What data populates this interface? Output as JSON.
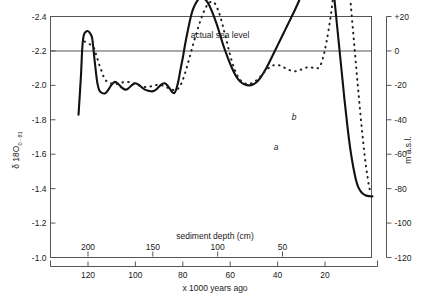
{
  "chart_data": {
    "type": "line",
    "title": "",
    "annotations": [
      {
        "text": "actual sea level",
        "x_px": 220,
        "y_px": 38
      },
      {
        "text": "a",
        "x_px": 276,
        "y_px": 150
      },
      {
        "text": "b",
        "x_px": 294,
        "y_px": 120
      }
    ],
    "axes": {
      "left": {
        "label": "δ 18O",
        "label_sub": "0 - 81",
        "ticks": [
          "-2.4",
          "-2.2",
          "-2.0",
          "-1.8",
          "-1.6",
          "-1.4",
          "-1.2",
          "-1.0"
        ],
        "range": [
          -2.4,
          -1.0
        ],
        "inverted": true
      },
      "right": {
        "label": "m a.s.l.",
        "ticks": [
          "+20",
          "0",
          "-20",
          "-40",
          "-60",
          "-80",
          "-100",
          "-120"
        ],
        "range": [
          20,
          -120
        ]
      },
      "bottom": {
        "label": "x 1000 years ago",
        "ticks": [
          "120",
          "100",
          "80",
          "60",
          "40",
          "20"
        ],
        "tick_values": [
          120,
          100,
          80,
          60,
          40,
          20
        ]
      },
      "top": {
        "label": "sediment depth (cm)",
        "ticks": [
          "200",
          "150",
          "100",
          "50"
        ],
        "tick_values": [
          200,
          150,
          100,
          50
        ]
      },
      "grid": false,
      "legend": "inline-labels"
    },
    "series": [
      {
        "name": "a",
        "style": "solid",
        "description": "oxygen isotope / sea level curve, solid line",
        "points": [
          [
            124,
            -1.83
          ],
          [
            123,
            -2.05
          ],
          [
            122.4,
            -2.22
          ],
          [
            121.8,
            -2.29
          ],
          [
            121,
            -2.31
          ],
          [
            120,
            -2.315
          ],
          [
            119,
            -2.3
          ],
          [
            118.2,
            -2.27
          ],
          [
            117.4,
            -2.17
          ],
          [
            116.6,
            -2.07
          ],
          [
            116,
            -2.01
          ],
          [
            115.2,
            -1.97
          ],
          [
            114,
            -1.955
          ],
          [
            112.6,
            -1.955
          ],
          [
            111.4,
            -1.975
          ],
          [
            110,
            -2.005
          ],
          [
            108.6,
            -2.02
          ],
          [
            107,
            -2.005
          ],
          [
            105.6,
            -1.985
          ],
          [
            104.2,
            -1.975
          ],
          [
            103,
            -1.982
          ],
          [
            101.6,
            -2.0
          ],
          [
            100.2,
            -2.012
          ],
          [
            98.8,
            -2.005
          ],
          [
            97.4,
            -1.99
          ],
          [
            96,
            -1.975
          ],
          [
            94.4,
            -1.968
          ],
          [
            93,
            -1.965
          ],
          [
            91.6,
            -1.972
          ],
          [
            90.2,
            -1.99
          ],
          [
            89,
            -2.005
          ],
          [
            87.6,
            -2.012
          ],
          [
            86.4,
            -1.998
          ],
          [
            85.2,
            -1.975
          ],
          [
            84.2,
            -1.958
          ],
          [
            83.4,
            -1.958
          ],
          [
            82.6,
            -1.985
          ],
          [
            81.8,
            -2.03
          ],
          [
            81,
            -2.09
          ],
          [
            80,
            -2.16
          ],
          [
            79,
            -2.24
          ],
          [
            78,
            -2.31
          ],
          [
            77,
            -2.375
          ],
          [
            76,
            -2.43
          ],
          [
            74.8,
            -2.47
          ],
          [
            73.4,
            -2.5
          ],
          [
            72,
            -2.51
          ],
          [
            70.6,
            -2.5
          ],
          [
            69,
            -2.47
          ],
          [
            67.4,
            -2.42
          ],
          [
            65.8,
            -2.36
          ],
          [
            64.2,
            -2.29
          ],
          [
            62.6,
            -2.22
          ],
          [
            61,
            -2.16
          ],
          [
            59.4,
            -2.105
          ],
          [
            58,
            -2.065
          ],
          [
            56.6,
            -2.035
          ],
          [
            55.2,
            -2.015
          ],
          [
            53.6,
            -2.003
          ],
          [
            52,
            -2.0
          ],
          [
            50.4,
            -2.005
          ],
          [
            48.8,
            -2.02
          ],
          [
            47.2,
            -2.045
          ],
          [
            45.6,
            -2.08
          ],
          [
            44,
            -2.12
          ],
          [
            42.4,
            -2.165
          ],
          [
            40.8,
            -2.21
          ],
          [
            39.2,
            -2.255
          ],
          [
            37.6,
            -2.3
          ],
          [
            36,
            -2.345
          ],
          [
            34.4,
            -2.39
          ],
          [
            32.8,
            -2.435
          ],
          [
            31,
            -2.49
          ],
          [
            29.4,
            -2.545
          ],
          [
            27.8,
            -2.6
          ],
          [
            26.2,
            -2.655
          ],
          [
            24.6,
            -2.705
          ],
          [
            23.2,
            -2.745
          ],
          [
            22,
            -2.775
          ],
          [
            21,
            -2.79
          ],
          [
            20,
            -2.795
          ],
          [
            19,
            -2.78
          ],
          [
            18.2,
            -2.74
          ],
          [
            17.4,
            -2.67
          ],
          [
            16.6,
            -2.58
          ],
          [
            15.8,
            -2.47
          ],
          [
            15,
            -2.36
          ],
          [
            14.2,
            -2.25
          ],
          [
            13.4,
            -2.14
          ],
          [
            12.6,
            -2.03
          ],
          [
            11.8,
            -1.92
          ],
          [
            11,
            -1.82
          ],
          [
            10,
            -1.7
          ],
          [
            9,
            -1.6
          ],
          [
            8,
            -1.52
          ],
          [
            7,
            -1.455
          ],
          [
            6,
            -1.41
          ],
          [
            5,
            -1.385
          ],
          [
            4,
            -1.37
          ],
          [
            3,
            -1.362
          ],
          [
            2,
            -1.358
          ],
          [
            1,
            -1.356
          ],
          [
            0,
            -1.355
          ]
        ]
      },
      {
        "name": "b",
        "style": "dotted",
        "description": "second curve, dotted line",
        "points": [
          [
            121.4,
            -2.255
          ],
          [
            120.4,
            -2.245
          ],
          [
            119.4,
            -2.24
          ],
          [
            118.4,
            -2.23
          ],
          [
            117.4,
            -2.215
          ],
          [
            116.6,
            -2.18
          ],
          [
            115.8,
            -2.145
          ],
          [
            115,
            -2.11
          ],
          [
            114.2,
            -2.08
          ],
          [
            113.4,
            -2.05
          ],
          [
            112.6,
            -2.03
          ],
          [
            111.6,
            -2.02
          ],
          [
            110.4,
            -2.012
          ],
          [
            109.2,
            -2.008
          ],
          [
            108,
            -2.008
          ],
          [
            106.6,
            -2.012
          ],
          [
            105.2,
            -2.018
          ],
          [
            103.8,
            -2.02
          ],
          [
            102.4,
            -2.018
          ],
          [
            101,
            -2.012
          ],
          [
            99.6,
            -2.005
          ],
          [
            98.2,
            -1.998
          ],
          [
            96.8,
            -1.992
          ],
          [
            95.4,
            -1.99
          ],
          [
            94,
            -1.992
          ],
          [
            92.6,
            -1.998
          ],
          [
            91.2,
            -2.002
          ],
          [
            89.8,
            -2.002
          ],
          [
            88.4,
            -1.998
          ],
          [
            87,
            -1.99
          ],
          [
            85.6,
            -1.982
          ],
          [
            84.4,
            -1.975
          ],
          [
            83.2,
            -1.972
          ],
          [
            82.2,
            -1.978
          ],
          [
            81.2,
            -1.995
          ],
          [
            80.2,
            -2.025
          ],
          [
            79.2,
            -2.065
          ],
          [
            78.2,
            -2.11
          ],
          [
            77.2,
            -2.16
          ],
          [
            76.2,
            -2.21
          ],
          [
            75.2,
            -2.26
          ],
          [
            74.2,
            -2.305
          ],
          [
            73.2,
            -2.35
          ],
          [
            72.2,
            -2.39
          ],
          [
            71.2,
            -2.425
          ],
          [
            70.2,
            -2.455
          ],
          [
            69.2,
            -2.475
          ],
          [
            68.2,
            -2.485
          ],
          [
            67.2,
            -2.485
          ],
          [
            66.2,
            -2.47
          ],
          [
            65.2,
            -2.44
          ],
          [
            64.2,
            -2.4
          ],
          [
            63.2,
            -2.35
          ],
          [
            62.2,
            -2.295
          ],
          [
            61.2,
            -2.24
          ],
          [
            60.2,
            -2.185
          ],
          [
            59.2,
            -2.135
          ],
          [
            58.2,
            -2.095
          ],
          [
            57.2,
            -2.062
          ],
          [
            56.2,
            -2.038
          ],
          [
            55,
            -2.022
          ],
          [
            53.8,
            -2.012
          ],
          [
            52.4,
            -2.008
          ],
          [
            51,
            -2.012
          ],
          [
            49.6,
            -2.022
          ],
          [
            48.2,
            -2.038
          ],
          [
            46.8,
            -2.058
          ],
          [
            45.4,
            -2.08
          ],
          [
            44,
            -2.098
          ],
          [
            42.6,
            -2.112
          ],
          [
            41.2,
            -2.118
          ],
          [
            39.8,
            -2.118
          ],
          [
            38.4,
            -2.112
          ],
          [
            37,
            -2.102
          ],
          [
            35.6,
            -2.092
          ],
          [
            34.2,
            -2.085
          ],
          [
            32.8,
            -2.082
          ],
          [
            31.4,
            -2.085
          ],
          [
            30,
            -2.092
          ],
          [
            28.6,
            -2.1
          ],
          [
            27.2,
            -2.105
          ],
          [
            26,
            -2.105
          ],
          [
            24.8,
            -2.1
          ],
          [
            23.6,
            -2.098
          ],
          [
            22.4,
            -2.105
          ],
          [
            21.4,
            -2.135
          ],
          [
            20.4,
            -2.185
          ],
          [
            19.4,
            -2.25
          ],
          [
            18.4,
            -2.33
          ],
          [
            17.4,
            -2.42
          ],
          [
            16.6,
            -2.51
          ],
          [
            15.8,
            -2.6
          ],
          [
            15,
            -2.685
          ],
          [
            14.2,
            -2.755
          ],
          [
            13.4,
            -2.8
          ],
          [
            12.8,
            -2.825
          ],
          [
            12.2,
            -2.825
          ],
          [
            11.6,
            -2.79
          ],
          [
            11,
            -2.73
          ],
          [
            10.4,
            -2.655
          ],
          [
            9.8,
            -2.57
          ],
          [
            9.2,
            -2.48
          ],
          [
            8.6,
            -2.385
          ],
          [
            8,
            -2.29
          ],
          [
            7.4,
            -2.195
          ],
          [
            6.8,
            -2.1
          ],
          [
            6.2,
            -2.005
          ],
          [
            5.6,
            -1.915
          ],
          [
            5,
            -1.825
          ],
          [
            4.4,
            -1.74
          ],
          [
            3.8,
            -1.66
          ],
          [
            3.2,
            -1.585
          ],
          [
            2.6,
            -1.52
          ],
          [
            2,
            -1.465
          ],
          [
            1.5,
            -1.42
          ],
          [
            1,
            -1.39
          ],
          [
            0.5,
            -1.37
          ]
        ]
      }
    ]
  }
}
